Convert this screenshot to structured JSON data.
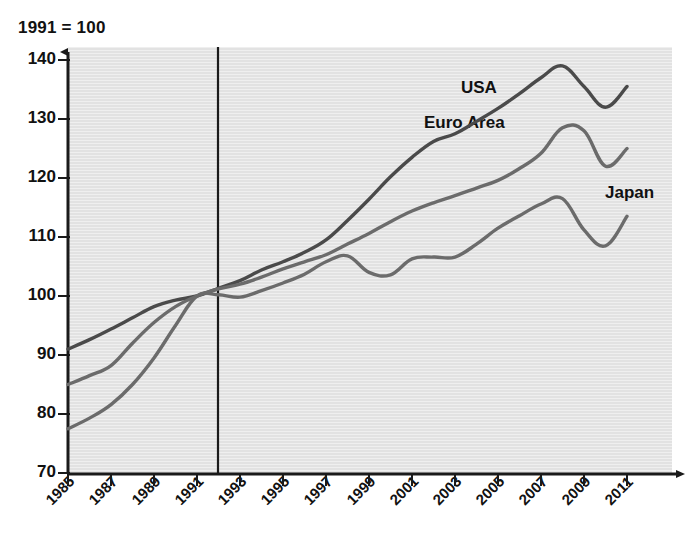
{
  "chart_data": {
    "type": "line",
    "title": "1991 = 100",
    "xlabel": "",
    "ylabel": "",
    "ylim": [
      70,
      140
    ],
    "ytick_values": [
      70,
      80,
      90,
      100,
      110,
      120,
      130,
      140
    ],
    "xlim": [
      1985,
      2011
    ],
    "xtick_labels": [
      "1985",
      "1987",
      "1989",
      "1991",
      "1993",
      "1995",
      "1997",
      "1999",
      "2001",
      "2003",
      "2005",
      "2007",
      "2009",
      "2011"
    ],
    "grid": false,
    "legend_position": "inline-annotations",
    "annotations": [
      {
        "text": "1991 reference line",
        "x": 1991,
        "type": "vertical-line"
      }
    ],
    "x": [
      1985,
      1986,
      1987,
      1988,
      1989,
      1990,
      1991,
      1992,
      1993,
      1994,
      1995,
      1996,
      1997,
      1998,
      1999,
      2000,
      2001,
      2002,
      2003,
      2004,
      2005,
      2006,
      2007,
      2008,
      2009,
      2010,
      2011
    ],
    "series": [
      {
        "name": "USA",
        "color": "#4a4a4a",
        "values": [
          91.0,
          92.6,
          94.4,
          96.3,
          98.2,
          99.3,
          100.0,
          101.3,
          102.6,
          104.4,
          105.8,
          107.4,
          109.5,
          112.8,
          116.4,
          120.2,
          123.5,
          126.2,
          127.5,
          129.6,
          131.8,
          134.3,
          137.0,
          139.0,
          135.5,
          132.0,
          135.5
        ]
      },
      {
        "name": "Euro Area",
        "color": "#6b6b6b",
        "values": [
          85.0,
          86.5,
          88.2,
          92.0,
          95.5,
          98.2,
          100.0,
          101.2,
          102.0,
          103.2,
          104.6,
          105.8,
          107.0,
          108.8,
          110.6,
          112.6,
          114.4,
          115.8,
          117.0,
          118.3,
          119.6,
          121.6,
          124.2,
          128.5,
          128.0,
          122.0,
          125.0
        ]
      },
      {
        "name": "Japan",
        "color": "#6b6b6b",
        "values": [
          77.5,
          79.3,
          81.6,
          85.0,
          89.5,
          95.0,
          100.0,
          100.2,
          99.8,
          100.9,
          102.2,
          103.7,
          105.8,
          106.8,
          104.0,
          103.6,
          106.3,
          106.6,
          106.6,
          108.8,
          111.5,
          113.6,
          115.6,
          116.5,
          111.2,
          108.5,
          113.5
        ]
      }
    ]
  },
  "axis": {
    "y_labels": [
      "140",
      "130",
      "120",
      "110",
      "100",
      "90",
      "80",
      "70"
    ],
    "x_labels": [
      "1985",
      "1987",
      "1989",
      "1991",
      "1993",
      "1995",
      "1997",
      "1999",
      "2001",
      "2003",
      "2005",
      "2007",
      "2009",
      "2011"
    ]
  },
  "series_labels": [
    {
      "text": "USA"
    },
    {
      "text": "Euro Area"
    },
    {
      "text": "Japan"
    }
  ]
}
